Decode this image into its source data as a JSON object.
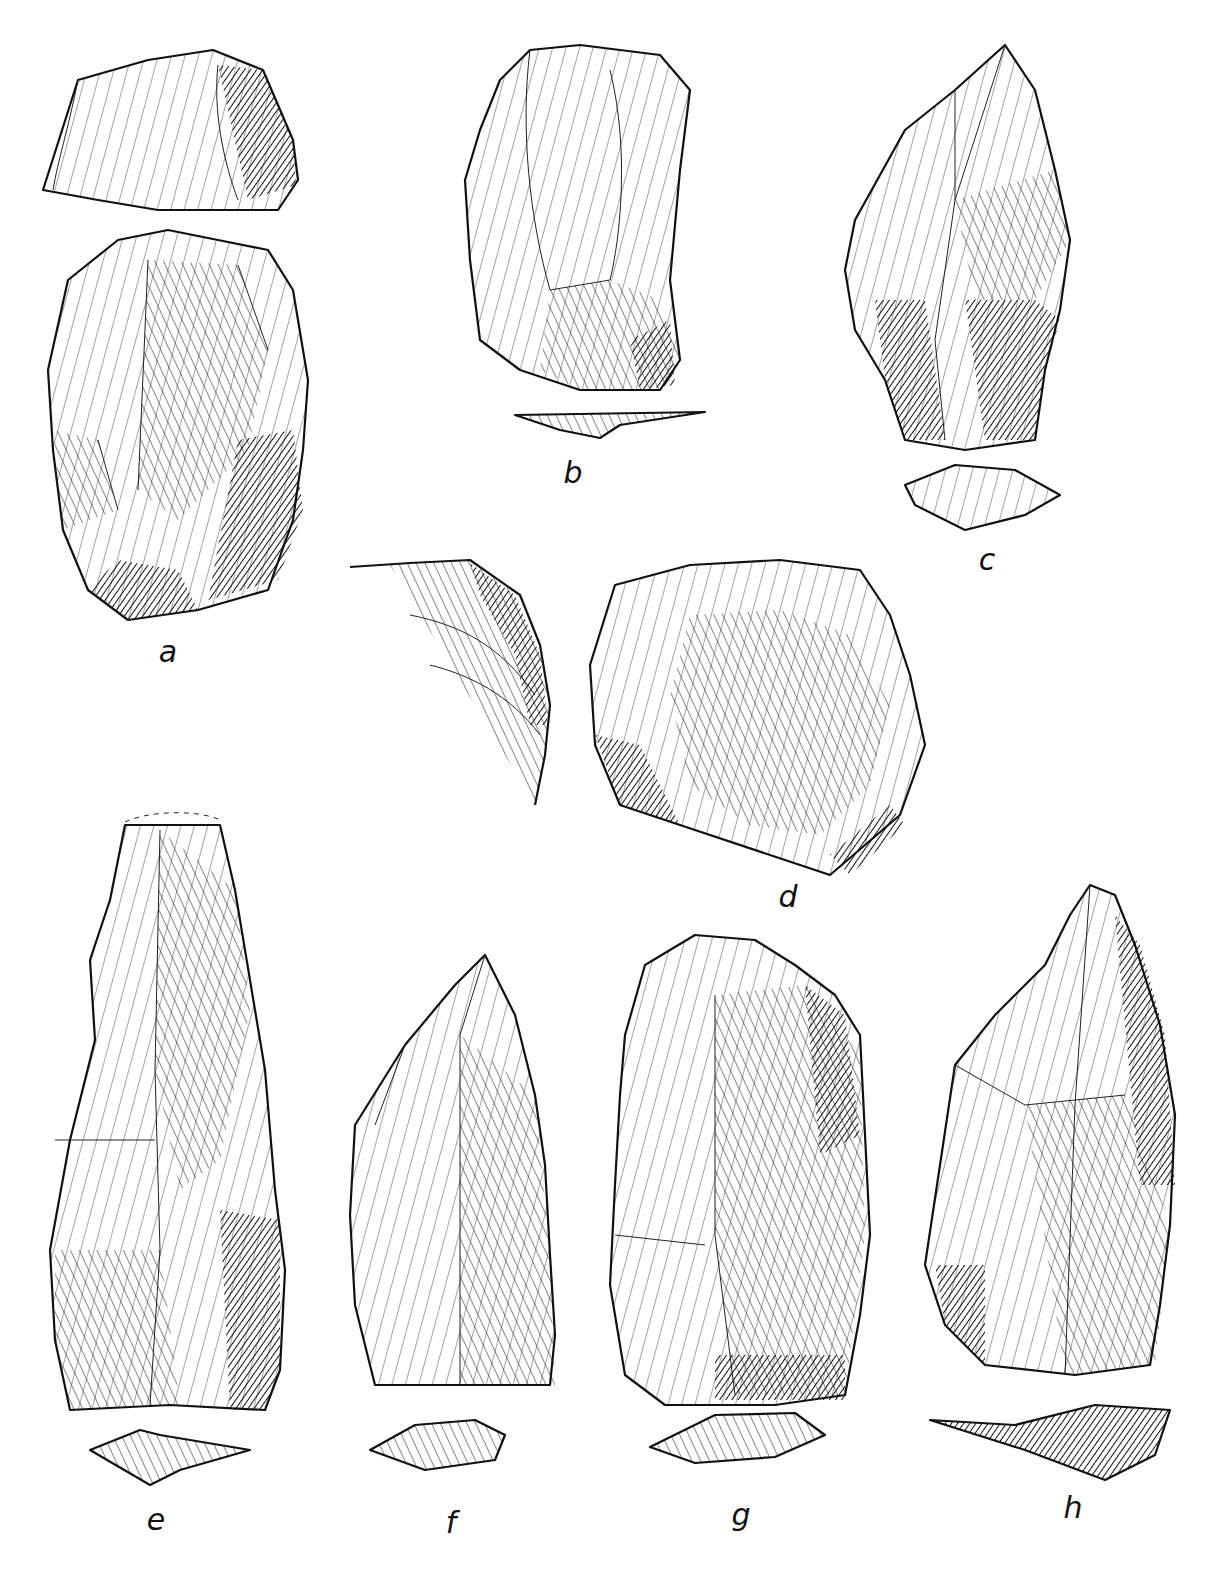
{
  "plate": {
    "type": "archaeological illustration plate",
    "subject": "flaked stone artifacts (lithic drawings)",
    "background": "#ffffff",
    "ink": "#111111"
  },
  "figures": [
    {
      "id": "a",
      "label": "a",
      "views": [
        "platform view",
        "dorsal face"
      ]
    },
    {
      "id": "b",
      "label": "b",
      "views": [
        "dorsal face",
        "cross-section"
      ]
    },
    {
      "id": "c",
      "label": "c",
      "views": [
        "dorsal face",
        "cross-section"
      ]
    },
    {
      "id": "d",
      "label": "d",
      "views": [
        "edge detail",
        "dorsal face"
      ]
    },
    {
      "id": "e",
      "label": "e",
      "views": [
        "dorsal face",
        "cross-section"
      ]
    },
    {
      "id": "f",
      "label": "f",
      "views": [
        "dorsal face",
        "cross-section"
      ]
    },
    {
      "id": "g",
      "label": "g",
      "views": [
        "dorsal face",
        "cross-section"
      ]
    },
    {
      "id": "h",
      "label": "h",
      "views": [
        "dorsal face",
        "cross-section"
      ]
    }
  ]
}
